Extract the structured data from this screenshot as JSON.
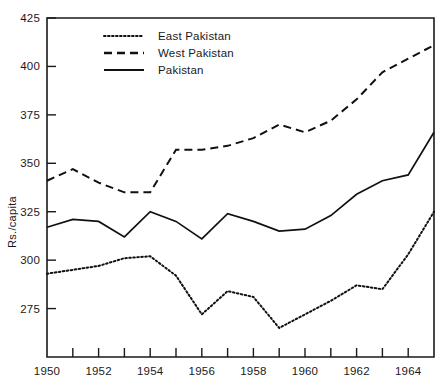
{
  "chart_data": {
    "type": "line",
    "title": "",
    "xlabel": "",
    "ylabel": "Rs./capita",
    "xlim": [
      1950,
      1965
    ],
    "ylim": [
      250,
      425
    ],
    "grid": false,
    "legend_position": "top-left-inside",
    "x": [
      1950,
      1951,
      1952,
      1953,
      1954,
      1955,
      1956,
      1957,
      1958,
      1959,
      1960,
      1961,
      1962,
      1963,
      1964,
      1965
    ],
    "y_ticks": [
      275,
      300,
      325,
      350,
      375,
      400,
      425
    ],
    "y_tick_labels": [
      "275",
      "300",
      "325",
      "350",
      "375",
      "400",
      "425"
    ],
    "x_ticks": [
      1950,
      1951,
      1952,
      1953,
      1954,
      1955,
      1956,
      1957,
      1958,
      1959,
      1960,
      1961,
      1962,
      1963,
      1964,
      1965
    ],
    "x_tick_labels": [
      "1950",
      "",
      "1952",
      "",
      "1954",
      "",
      "1956",
      "",
      "1958",
      "",
      "1960",
      "",
      "1962",
      "",
      "1964",
      ""
    ],
    "x_labeled_ticks": [
      1950,
      1952,
      1954,
      1956,
      1958,
      1960,
      1962,
      1964
    ],
    "series": [
      {
        "name": "East Pakistan",
        "style": "dotted",
        "color": "#111111",
        "values": [
          293,
          295,
          297,
          301,
          302,
          292,
          272,
          284,
          281,
          265,
          272,
          279,
          287,
          285,
          303,
          325
        ]
      },
      {
        "name": "West Pakistan",
        "style": "dashed",
        "color": "#111111",
        "values": [
          341,
          347,
          340,
          335,
          335,
          357,
          357,
          359,
          363,
          370,
          366,
          372,
          383,
          397,
          404,
          411
        ]
      },
      {
        "name": "Pakistan",
        "style": "solid",
        "color": "#111111",
        "values": [
          317,
          321,
          320,
          312,
          325,
          320,
          311,
          324,
          320,
          315,
          316,
          323,
          334,
          341,
          344,
          366
        ]
      }
    ]
  },
  "legend": {
    "entries": [
      {
        "label": "East Pakistan",
        "style": "dotted"
      },
      {
        "label": "West Pakistan",
        "style": "dashed"
      },
      {
        "label": "Pakistan",
        "style": "solid"
      }
    ]
  },
  "axes": {
    "y_axis_title": "Rs./capita"
  }
}
